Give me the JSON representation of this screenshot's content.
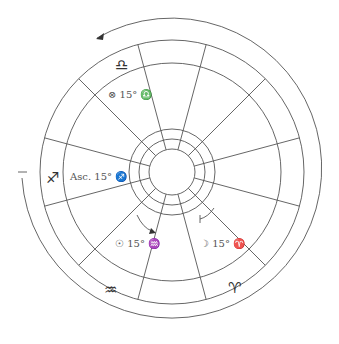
{
  "chart": {
    "center": [
      172,
      172
    ],
    "radii": {
      "hole": 23,
      "ring1": 33,
      "ring2": 43,
      "sign_inner": 109,
      "outer": 132,
      "arrow_arc": 150
    },
    "spoke_offset_deg": 15,
    "stroke_color": "#555555"
  },
  "signs": [
    {
      "name": "libra",
      "glyph": "♎",
      "x": 115,
      "y": 70
    },
    {
      "name": "sagittarius",
      "glyph": "♐",
      "x": 52,
      "y": 177
    },
    {
      "name": "aquarius",
      "glyph": "♒",
      "x": 111,
      "y": 289
    },
    {
      "name": "aries",
      "glyph": "♈",
      "x": 234,
      "y": 287
    }
  ],
  "placements": [
    {
      "name": "fortune-label",
      "text": "⊗ 15° ♎",
      "x": 108,
      "y": 98
    },
    {
      "name": "ascendant-label",
      "text": "Asc. 15° ♐",
      "x": 70,
      "y": 180
    },
    {
      "name": "sun-label",
      "text": "☉ 15° ♒",
      "x": 115,
      "y": 247
    },
    {
      "name": "moon-label",
      "text": "☽ 15° ♈",
      "x": 200,
      "y": 247
    }
  ]
}
